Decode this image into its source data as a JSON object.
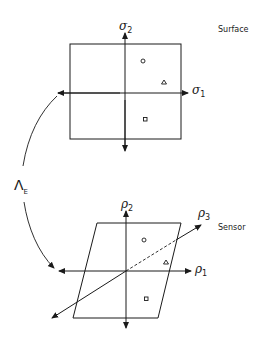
{
  "diagram": {
    "top_panel": {
      "title": "Surface",
      "axis_x_label": "σ",
      "axis_x_subscript": "1",
      "axis_y_label": "σ",
      "axis_y_subscript": "2",
      "markers": [
        {
          "shape": "circle"
        },
        {
          "shape": "triangle"
        },
        {
          "shape": "square"
        }
      ]
    },
    "bottom_panel": {
      "title": "Sensor",
      "axis_x_label": "ρ",
      "axis_x_subscript": "1",
      "axis_y_label": "ρ",
      "axis_y_subscript": "2",
      "axis_z_label": "ρ",
      "axis_z_subscript": "3",
      "markers": [
        {
          "shape": "circle"
        },
        {
          "shape": "triangle"
        },
        {
          "shape": "square"
        }
      ]
    },
    "mapping": {
      "label": "Λ",
      "subscript": "E"
    }
  }
}
